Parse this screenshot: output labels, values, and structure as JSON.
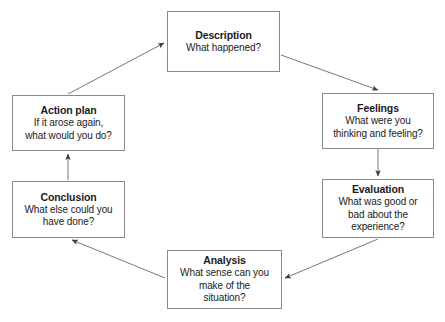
{
  "diagram": {
    "kind": "cycle-diagram",
    "box_border_color": "#8a8a8a",
    "text_color": "#1b1b1b",
    "arrow_color": "#5a5a5a",
    "background_color": "#ffffff",
    "nodes": [
      {
        "id": "description",
        "title": "Description",
        "lines": [
          "What happened?"
        ]
      },
      {
        "id": "feelings",
        "title": "Feelings",
        "lines": [
          "What were you",
          "thinking and feeling?"
        ]
      },
      {
        "id": "evaluation",
        "title": "Evaluation",
        "lines": [
          "What was good or",
          "bad about the",
          "experience?"
        ]
      },
      {
        "id": "analysis",
        "title": "Analysis",
        "lines": [
          "What sense can you",
          "make of the",
          "situation?"
        ]
      },
      {
        "id": "conclusion",
        "title": "Conclusion",
        "lines": [
          "What else could you",
          "have done?"
        ]
      },
      {
        "id": "action_plan",
        "title": "Action plan",
        "lines": [
          "If it arose again,",
          "what would you do?"
        ]
      }
    ]
  }
}
